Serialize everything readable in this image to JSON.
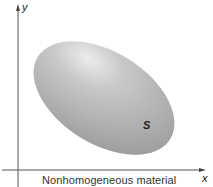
{
  "figure": {
    "axes": {
      "x_label": "x",
      "y_label": "y"
    },
    "region": {
      "label": "S",
      "fill_light": "#e2e2e2",
      "fill_mid": "#b4b4b4",
      "fill_dark": "#9a9a9a"
    },
    "caption": "Nonhomogeneous material",
    "colors": {
      "axis": "#555555",
      "background": "#ffffff"
    }
  }
}
